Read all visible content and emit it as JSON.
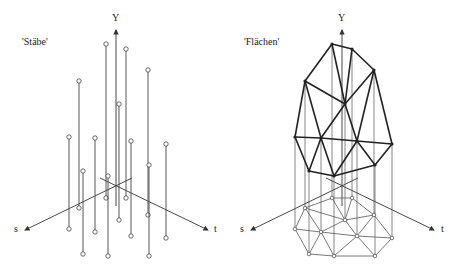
{
  "left": {
    "title": "'Stäbe'",
    "axis_y": "Y",
    "axis_s": "s",
    "axis_t": "t",
    "origin": [
      116,
      206
    ],
    "rods": [
      {
        "top": [
          106,
          44
        ],
        "bot": [
          106,
          198
        ]
      },
      {
        "top": [
          126,
          49
        ],
        "bot": [
          126,
          198
        ]
      },
      {
        "top": [
          148,
          70
        ],
        "bot": [
          148,
          215
        ]
      },
      {
        "top": [
          79,
          81
        ],
        "bot": [
          79,
          208
        ]
      },
      {
        "top": [
          119,
          104
        ],
        "bot": [
          119,
          220
        ]
      },
      {
        "top": [
          69,
          137
        ],
        "bot": [
          69,
          229
        ]
      },
      {
        "top": [
          95,
          138
        ],
        "bot": [
          95,
          232
        ]
      },
      {
        "top": [
          131,
          141
        ],
        "bot": [
          131,
          236
        ]
      },
      {
        "top": [
          166,
          144
        ],
        "bot": [
          166,
          238
        ]
      },
      {
        "top": [
          83,
          171
        ],
        "bot": [
          83,
          254
        ]
      },
      {
        "top": [
          149,
          165
        ],
        "bot": [
          149,
          256
        ]
      },
      {
        "top": [
          108,
          176
        ],
        "bot": [
          108,
          256
        ]
      }
    ]
  },
  "right": {
    "title": "'Flächen'",
    "axis_y": "Y",
    "axis_s": "s",
    "axis_t": "t",
    "top": [
      [
        332,
        44
      ],
      [
        352,
        49
      ],
      [
        374,
        70
      ],
      [
        305,
        81
      ],
      [
        345,
        104
      ],
      [
        295,
        137
      ],
      [
        321,
        138
      ],
      [
        357,
        141
      ],
      [
        392,
        144
      ],
      [
        309,
        171
      ],
      [
        375,
        165
      ],
      [
        334,
        176
      ]
    ],
    "bottom": [
      [
        332,
        198
      ],
      [
        352,
        198
      ],
      [
        374,
        215
      ],
      [
        305,
        208
      ],
      [
        345,
        220
      ],
      [
        295,
        229
      ],
      [
        321,
        232
      ],
      [
        357,
        236
      ],
      [
        392,
        238
      ],
      [
        309,
        254
      ],
      [
        375,
        256
      ],
      [
        334,
        256
      ]
    ],
    "edges": [
      [
        0,
        1
      ],
      [
        1,
        2
      ],
      [
        0,
        3
      ],
      [
        0,
        4
      ],
      [
        1,
        4
      ],
      [
        2,
        4
      ],
      [
        3,
        4
      ],
      [
        3,
        5
      ],
      [
        3,
        6
      ],
      [
        4,
        6
      ],
      [
        4,
        7
      ],
      [
        2,
        7
      ],
      [
        2,
        8
      ],
      [
        5,
        6
      ],
      [
        6,
        7
      ],
      [
        7,
        8
      ],
      [
        5,
        9
      ],
      [
        6,
        9
      ],
      [
        9,
        11
      ],
      [
        6,
        11
      ],
      [
        7,
        11
      ],
      [
        7,
        10
      ],
      [
        8,
        10
      ],
      [
        11,
        10
      ]
    ]
  }
}
